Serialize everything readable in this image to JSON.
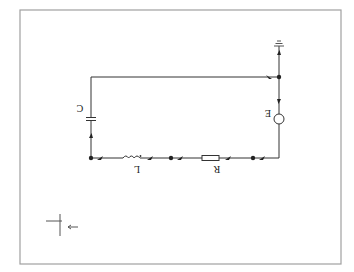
{
  "diagram": {
    "type": "electrical-circuit",
    "orientation": "rotated-180",
    "components": [
      {
        "id": "E",
        "label": "E",
        "kind": "voltage-source"
      },
      {
        "id": "R",
        "label": "R",
        "kind": "resistor"
      },
      {
        "id": "L",
        "label": "L",
        "kind": "inductor"
      },
      {
        "id": "C",
        "label": "C",
        "kind": "capacitor"
      },
      {
        "id": "G",
        "label": "",
        "kind": "ground"
      }
    ],
    "labels": {
      "source": "E",
      "resistor": "R",
      "inductor": "L",
      "capacitor": "C"
    },
    "colors": {
      "wire": "#333333",
      "border": "#999999",
      "background": "#ffffff"
    }
  }
}
